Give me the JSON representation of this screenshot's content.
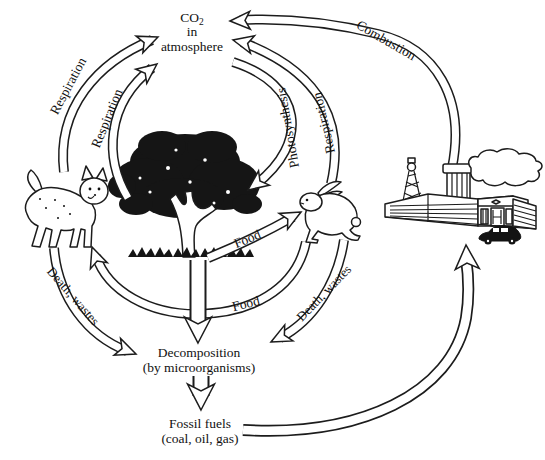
{
  "colors": {
    "ink": "#1c1c1c",
    "paper": "#ffffff"
  },
  "atmosphere": {
    "formula_base": "CO",
    "formula_sub": "2",
    "line2": "in",
    "line3": "atmosphere"
  },
  "flows": {
    "respiration_carnivore": "Respiration",
    "respiration_plant": "Respiration",
    "photosynthesis": "Photosynthesis",
    "respiration_herbivore": "Respiration",
    "combustion": "Combustion",
    "food_plant_to_herbivore": "Food",
    "food_herbivore_to_carnivore": "Food",
    "death_wastes_left": "Death, wastes",
    "death_wastes_right": "Death, wastes"
  },
  "nodes": {
    "decomposition_title": "Decomposition",
    "decomposition_sub": "(by microorganisms)",
    "fossil_title": "Fossil fuels",
    "fossil_sub": "(coal, oil, gas)"
  },
  "icons": {
    "carnivore": "bobcat-icon",
    "herbivore": "rabbit-icon",
    "plant": "tree-icon",
    "industry": "factory-icon"
  }
}
